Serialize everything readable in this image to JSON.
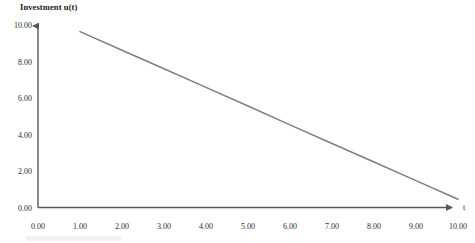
{
  "chart_data": {
    "type": "line",
    "title": "Investment u(t)",
    "xlabel": "t",
    "ylabel": "",
    "xlim": [
      0,
      10
    ],
    "ylim": [
      0,
      10
    ],
    "grid": false,
    "legend": null,
    "line_color": "#7f7f7f",
    "axis_color": "#595959",
    "x_ticks": [
      "0.00",
      "1.00",
      "2.00",
      "3.00",
      "4.00",
      "5.00",
      "6.00",
      "7.00",
      "8.00",
      "9.00",
      "10.00"
    ],
    "y_ticks": [
      "0.00",
      "2.00",
      "4.00",
      "6.00",
      "8.00",
      "10.00"
    ],
    "x_tick_values": [
      0,
      1,
      2,
      3,
      4,
      5,
      6,
      7,
      8,
      9,
      10
    ],
    "y_tick_values": [
      0,
      2,
      4,
      6,
      8,
      10
    ],
    "series": [
      {
        "name": "u(t)",
        "x": [
          1,
          2,
          3,
          4,
          5,
          6,
          7,
          8,
          9,
          10
        ],
        "values": [
          9.64,
          8.62,
          7.6,
          6.58,
          5.56,
          4.53,
          3.51,
          2.49,
          1.47,
          0.45
        ]
      }
    ]
  },
  "axes": {
    "x_arrow": "arrow-right",
    "y_arrow": "arrow-up"
  }
}
